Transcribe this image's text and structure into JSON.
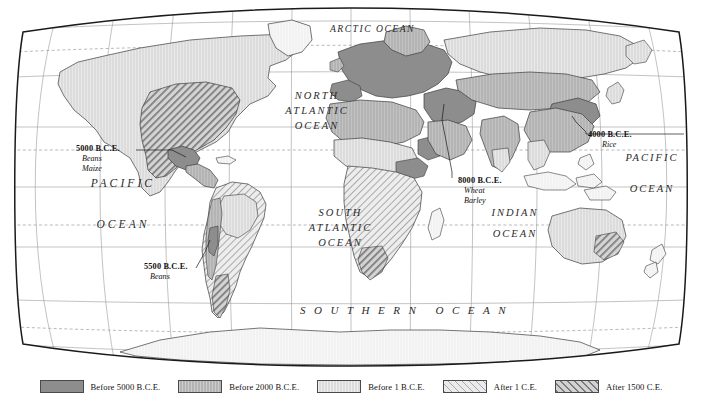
{
  "map": {
    "projection_type": "robinson-oval",
    "ocean_labels": [
      {
        "id": "arctic",
        "lines": [
          "ARCTIC OCEAN"
        ]
      },
      {
        "id": "north-atlantic",
        "lines": [
          "NORTH",
          "ATLANTIC",
          "OCEAN"
        ]
      },
      {
        "id": "pacific-west",
        "lines": [
          "PACIFIC",
          "OCEAN"
        ]
      },
      {
        "id": "south-atlantic",
        "lines": [
          "SOUTH",
          "ATLANTIC",
          "OCEAN"
        ]
      },
      {
        "id": "indian",
        "lines": [
          "INDIAN",
          "OCEAN"
        ]
      },
      {
        "id": "pacific-east",
        "lines": [
          "PACIFIC",
          "OCEAN"
        ]
      },
      {
        "id": "southern",
        "lines": [
          "SOUTHERN  OCEAN"
        ]
      }
    ],
    "annotations": [
      {
        "id": "mesoamerica",
        "date": "5000 B.C.E.",
        "crops": [
          "Beans",
          "Maize"
        ]
      },
      {
        "id": "andes",
        "date": "5500 B.C.E.",
        "crops": [
          "Beans"
        ]
      },
      {
        "id": "fertile-crescent",
        "date": "8000 B.C.E.",
        "crops": [
          "Wheat",
          "Barley"
        ]
      },
      {
        "id": "east-asia",
        "date": "4000 B.C.E.",
        "crops": [
          "Rice"
        ]
      }
    ]
  },
  "legend": {
    "items": [
      {
        "id": "before-5000-bce",
        "label": "Before 5000 B.C.E.",
        "color": "#8d8d8d",
        "pattern": "solid"
      },
      {
        "id": "before-2000-bce",
        "label": "Before 2000 B.C.E.",
        "color": "#b4b4b4",
        "pattern": "solid"
      },
      {
        "id": "before-1-bce",
        "label": "Before 1 B.C.E.",
        "color": "#dcdcdc",
        "pattern": "solid"
      },
      {
        "id": "after-1-ce",
        "label": "After 1 C.E.",
        "color": "#ebebeb",
        "pattern": "diagonal-thin"
      },
      {
        "id": "after-1500-ce",
        "label": "After 1500 C.E.",
        "color": "#d2d2d2",
        "pattern": "diagonal-bold"
      }
    ]
  },
  "colors": {
    "border": "#1a1a1a",
    "graticule": "#8a8a8a",
    "tropic_line": "#8a8a8a",
    "coastline": "#3c3c3c",
    "land_base": "#f2f2f2",
    "ocean": "#ffffff"
  }
}
